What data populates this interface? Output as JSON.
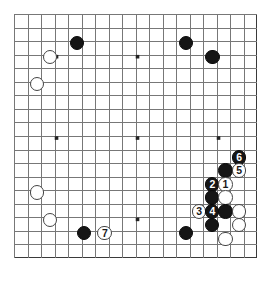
{
  "diagram": {
    "type": "go-board-diagram",
    "board_size": 19,
    "visible_columns": 18,
    "visible_rows": 18,
    "line_color": "#777777",
    "border_color": "#3a3a3a",
    "black_color": "#151515",
    "white_color": "#ffffff",
    "background_color": "#ffffff",
    "star_points": [
      {
        "col": 3,
        "row": 3
      },
      {
        "col": 9,
        "row": 3
      },
      {
        "col": 15,
        "row": 3
      },
      {
        "col": 3,
        "row": 9
      },
      {
        "col": 9,
        "row": 9
      },
      {
        "col": 15,
        "row": 9
      },
      {
        "col": 3,
        "row": 15
      },
      {
        "col": 9,
        "row": 15
      },
      {
        "col": 15,
        "row": 15
      }
    ],
    "stones": [
      {
        "id": "b-d16",
        "color": "black",
        "col": 4.65,
        "row": 2.15,
        "label": ""
      },
      {
        "id": "w-c15",
        "color": "white",
        "col": 2.67,
        "row": 3.18,
        "label": ""
      },
      {
        "id": "w-b13",
        "color": "white",
        "col": 1.7,
        "row": 5.18,
        "label": ""
      },
      {
        "id": "b-n16",
        "color": "black",
        "col": 12.75,
        "row": 2.15,
        "label": ""
      },
      {
        "id": "b-p15",
        "color": "black",
        "col": 14.7,
        "row": 3.18,
        "label": ""
      },
      {
        "id": "b-move6",
        "color": "black",
        "col": 16.67,
        "row": 10.6,
        "label": "6"
      },
      {
        "id": "b-r10",
        "color": "black",
        "col": 15.65,
        "row": 11.55,
        "label": ""
      },
      {
        "id": "w-move5",
        "color": "white",
        "col": 16.67,
        "row": 11.55,
        "label": "5"
      },
      {
        "id": "b-move2",
        "color": "black",
        "col": 14.68,
        "row": 12.58,
        "label": "2"
      },
      {
        "id": "w-move1",
        "color": "white",
        "col": 15.65,
        "row": 12.58,
        "label": "1"
      },
      {
        "id": "b-r8",
        "color": "black",
        "col": 14.68,
        "row": 13.55,
        "label": ""
      },
      {
        "id": "w-s8",
        "color": "white",
        "col": 15.65,
        "row": 13.55,
        "label": ""
      },
      {
        "id": "w-move3",
        "color": "white",
        "col": 13.7,
        "row": 14.58,
        "label": "3"
      },
      {
        "id": "b-move4",
        "color": "black",
        "col": 14.68,
        "row": 14.58,
        "label": "4"
      },
      {
        "id": "b-s7",
        "color": "black",
        "col": 15.65,
        "row": 14.58,
        "label": ""
      },
      {
        "id": "w-t7",
        "color": "white",
        "col": 16.67,
        "row": 14.58,
        "label": ""
      },
      {
        "id": "b-r6",
        "color": "black",
        "col": 14.68,
        "row": 15.55,
        "label": ""
      },
      {
        "id": "w-t6",
        "color": "white",
        "col": 16.67,
        "row": 15.55,
        "label": ""
      },
      {
        "id": "w-s5",
        "color": "white",
        "col": 15.65,
        "row": 16.58,
        "label": ""
      },
      {
        "id": "b-n4",
        "color": "black",
        "col": 12.75,
        "row": 16.15,
        "label": ""
      },
      {
        "id": "w-c6",
        "color": "white",
        "col": 1.7,
        "row": 13.18,
        "label": ""
      },
      {
        "id": "w-d4",
        "color": "white",
        "col": 2.67,
        "row": 15.18,
        "label": ""
      },
      {
        "id": "b-f3",
        "color": "black",
        "col": 5.18,
        "row": 16.15,
        "label": ""
      },
      {
        "id": "w-move7",
        "color": "white",
        "col": 6.72,
        "row": 16.15,
        "label": "7"
      }
    ]
  }
}
